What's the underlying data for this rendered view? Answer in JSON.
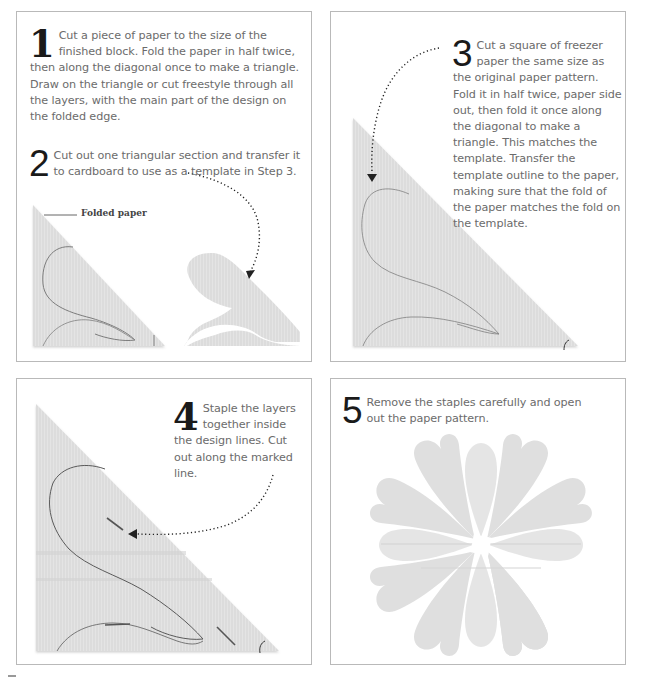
{
  "colors": {
    "paper": "#dedede",
    "paper_light": "#e6e6e6",
    "pencil_line": "#7c7c7c",
    "arrow": "#222222",
    "panel_border": "#b9b9b9",
    "text": "#6b6b6b",
    "step_number": "#1a1a1a"
  },
  "panels": [
    {
      "id": "panel-1",
      "steps": [
        {
          "number": "1",
          "text": "Cut a piece of paper to the size of the finished block. Fold the paper in half twice, then along the diagonal once to make a triangle. Draw on the triangle or cut freestyle through all the layers, with the main part of the design on the folded edge."
        },
        {
          "number": "2",
          "text": "Cut out one triangular section and transfer it to cardboard to use as a template in Step 3."
        }
      ],
      "label": "Folded paper",
      "illustrations": [
        "folded-paper-triangle-with-pencil-design",
        "cut-template-piece"
      ]
    },
    {
      "id": "panel-2",
      "steps": [
        {
          "number": "3",
          "text": "Cut a square of freezer paper the same size as the original paper pattern. Fold it in half twice, paper side out, then fold it once along the diagonal to make a triangle. This matches the template. Transfer the template outline to the paper, making sure that the fold of the paper matches the fold on the template."
        }
      ],
      "illustrations": [
        "freezer-paper-triangle-with-traced-outline"
      ]
    },
    {
      "id": "panel-3",
      "steps": [
        {
          "number": "4",
          "text": "Staple the layers together inside the design lines. Cut out along the marked line."
        }
      ],
      "illustrations": [
        "stapled-triangle-with-design-lines"
      ]
    },
    {
      "id": "panel-4",
      "steps": [
        {
          "number": "5",
          "text": "Remove the staples carefully and open out the paper pattern."
        }
      ],
      "illustrations": [
        "unfolded-eight-petal-paper-pattern"
      ]
    }
  ]
}
